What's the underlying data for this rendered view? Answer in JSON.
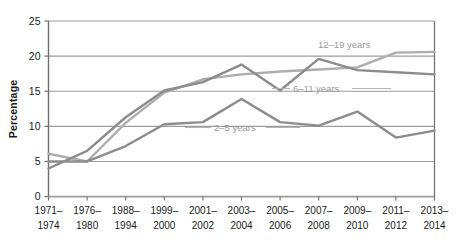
{
  "chart_data": {
    "type": "line",
    "title": "",
    "xlabel": "",
    "ylabel": "Percentage",
    "ylim": [
      0,
      25
    ],
    "yticks": [
      0,
      5,
      10,
      15,
      20,
      25
    ],
    "grid": "horizontal",
    "legend_position": "inline-labels",
    "categories": [
      "1971–1974",
      "1976–1980",
      "1988–1994",
      "1999–2000",
      "2001–2002",
      "2003–2004",
      "2005–2006",
      "2007–2008",
      "2009–2010",
      "2011–2012",
      "2013–2014"
    ],
    "categories_lines": [
      [
        "1971–",
        "1974"
      ],
      [
        "1976–",
        "1980"
      ],
      [
        "1988–",
        "1994"
      ],
      [
        "1999–",
        "2000"
      ],
      [
        "2001–",
        "2002"
      ],
      [
        "2003–",
        "2004"
      ],
      [
        "2005–",
        "2006"
      ],
      [
        "2007–",
        "2008"
      ],
      [
        "2009–",
        "2010"
      ],
      [
        "2011–",
        "2012"
      ],
      [
        "2013–",
        "2014"
      ]
    ],
    "series": [
      {
        "name": "2–5 years",
        "color": "#8c8c8c",
        "values": [
          5.0,
          5.0,
          7.2,
          10.3,
          10.6,
          13.9,
          10.6,
          10.1,
          12.1,
          8.4,
          9.4
        ]
      },
      {
        "name": "6–11 years",
        "color": "#8c8c8c",
        "values": [
          4.0,
          6.5,
          11.3,
          15.1,
          16.3,
          18.8,
          15.1,
          19.6,
          18.0,
          17.7,
          17.4
        ]
      },
      {
        "name": "12–19 years",
        "color": "#adadad",
        "values": [
          6.1,
          5.0,
          10.5,
          14.8,
          16.7,
          17.4,
          17.8,
          18.1,
          18.4,
          20.5,
          20.6
        ]
      }
    ],
    "annotations": [
      {
        "text": "12–19 years",
        "series": "12–19 years"
      },
      {
        "text": "6–11 years",
        "series": "6–11 years"
      },
      {
        "text": "2–5 years",
        "series": "2–5 years"
      }
    ],
    "colors": {
      "axis": "#6e6e6e",
      "grid": "#9d9d9d",
      "text": "#1a1a1a",
      "label_text": "#9a9a9a",
      "background": "#ffffff",
      "series_dark": "#8c8c8c",
      "series_light": "#adadad"
    }
  }
}
